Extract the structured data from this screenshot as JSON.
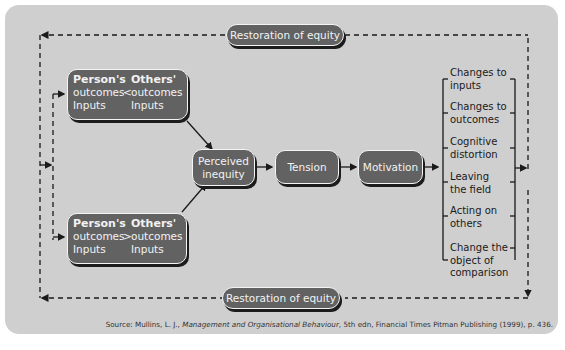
{
  "diagram": {
    "comparison_top": {
      "person_label": "Person's",
      "others_label": "Others'",
      "operator": "<",
      "row2_left": "outcomes",
      "row2_right": "outcomes",
      "row3_left": "Inputs",
      "row3_right": "Inputs"
    },
    "comparison_bottom": {
      "person_label": "Person's",
      "others_label": "Others'",
      "operator": ">",
      "row2_left": "outcomes",
      "row2_right": "outcomes",
      "row3_left": "Inputs",
      "row3_right": "Inputs"
    },
    "flow": {
      "perceived_line1": "Perceived",
      "perceived_line2": "inequity",
      "tension": "Tension",
      "motivation": "Motivation"
    },
    "options": [
      {
        "line1": "Changes to",
        "line2": "inputs"
      },
      {
        "line1": "Changes to",
        "line2": "outcomes"
      },
      {
        "line1": "Cognitive",
        "line2": "distortion"
      },
      {
        "line1": "Leaving",
        "line2": "the field"
      },
      {
        "line1": "Acting on",
        "line2": "others"
      },
      {
        "line1": "Change the",
        "line2": "object of",
        "line3": "comparison"
      }
    ],
    "restoration_top": "Restoration of equity",
    "restoration_bottom": "Restoration of equity",
    "source": {
      "prefix": "Source: Mullins, L. J., ",
      "book": "Management and Organisational Behaviour",
      "suffix": ", 5th edn, Financial Times Pitman Publishing (1999), p. 436."
    }
  },
  "colors": {
    "panel": "#cfcfcf",
    "box_fill": "#626262",
    "box_border": "#f4f4f4",
    "shadow": "#1c1c1c",
    "text_dark": "#1a1a1a"
  }
}
